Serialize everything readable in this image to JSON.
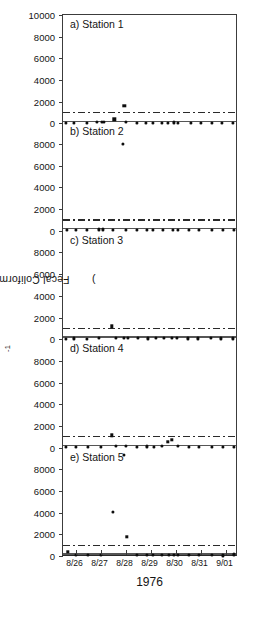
{
  "figure": {
    "ylabel_text": "Fecal Coliforms (cells · 100ml",
    "ylabel_sup": "-1",
    "ylabel_close": ")",
    "xlabel": "1976"
  },
  "axis": {
    "y_ticks": [
      0,
      2000,
      4000,
      6000,
      8000,
      10000
    ],
    "y_tick_labels": [
      "0",
      "2000",
      "4000",
      "6000",
      "8000",
      "10000"
    ],
    "ylim": [
      0,
      10000
    ],
    "x_tick_labels": [
      "8/26",
      "8/27",
      "8/28",
      "8/29",
      "8/30",
      "8/31",
      "9/01"
    ],
    "xlim": [
      0,
      7
    ]
  },
  "chart_data": {
    "type": "scatter",
    "title": "",
    "subtitle": "",
    "xlabel": "1976",
    "ylabel": "Fecal Coliforms (cells · 100ml-1)",
    "ylim": [
      0,
      10000
    ],
    "xlim": [
      0,
      7
    ],
    "grid": false,
    "legend": "none",
    "x_tick_labels": [
      "8/26",
      "8/27",
      "8/28",
      "8/29",
      "8/30",
      "8/31",
      "9/01"
    ],
    "y_tick_labels": [
      "0",
      "2000",
      "4000",
      "6000",
      "8000",
      "10000"
    ],
    "annotations": [
      "Each panel shares a 0-10000 y-scale.",
      "Upper dash-dot reference line at 1000 cells/100ml.",
      "Lower dash-dot reference line at 200 cells/100ml."
    ],
    "reference_lines": [
      {
        "name": "upper-standard",
        "value": 1000,
        "style": "dash-dot"
      },
      {
        "name": "lower-standard",
        "value": 200,
        "style": "dash-dot"
      }
    ],
    "panels": [
      {
        "id": "a",
        "label": "a) Station 1",
        "station": "Station 1",
        "x": [
          0.12,
          0.42,
          0.95,
          1.35,
          1.55,
          1.62,
          2.05,
          2.45,
          2.52,
          2.95,
          3.3,
          3.6,
          3.95,
          4.2,
          4.45,
          4.6,
          5.1,
          5.5,
          5.95,
          6.35,
          6.8
        ],
        "values": [
          60,
          70,
          60,
          120,
          150,
          160,
          380,
          1600,
          120,
          70,
          60,
          80,
          70,
          60,
          90,
          80,
          70,
          60,
          80,
          60,
          70
        ]
      },
      {
        "id": "b",
        "label": "b) Station 2",
        "station": "Station 2",
        "x": [
          0.15,
          0.5,
          0.95,
          1.45,
          1.6,
          2.0,
          2.4,
          2.5,
          2.95,
          3.35,
          3.6,
          4.0,
          4.4,
          4.6,
          5.05,
          5.45,
          5.95,
          6.4,
          6.85
        ],
        "values": [
          70,
          60,
          70,
          120,
          130,
          100,
          8050,
          110,
          80,
          90,
          70,
          80,
          110,
          90,
          70,
          80,
          70,
          60,
          80
        ]
      },
      {
        "id": "c",
        "label": "c) Station 3",
        "station": "Station 3",
        "x": [
          0.1,
          0.45,
          0.95,
          1.45,
          1.95,
          2.1,
          2.45,
          2.6,
          3.0,
          3.4,
          3.7,
          4.05,
          4.35,
          4.55,
          5.0,
          5.4,
          5.9,
          6.3,
          6.8
        ],
        "values": [
          60,
          70,
          60,
          90,
          1200,
          110,
          140,
          120,
          90,
          80,
          100,
          120,
          130,
          110,
          80,
          70,
          90,
          70,
          80
        ]
      },
      {
        "id": "d",
        "label": "d) Station 4",
        "station": "Station 4",
        "x": [
          0.12,
          0.5,
          1.0,
          1.5,
          1.95,
          2.1,
          2.5,
          2.95,
          3.35,
          3.65,
          3.95,
          4.2,
          4.35,
          4.6,
          5.05,
          5.45,
          5.95,
          6.4,
          6.85
        ],
        "values": [
          70,
          60,
          80,
          100,
          1150,
          120,
          130,
          90,
          110,
          100,
          120,
          560,
          700,
          130,
          90,
          80,
          70,
          60,
          90
        ]
      },
      {
        "id": "e",
        "label": "e) Station 5",
        "station": "Station 5",
        "x": [
          0.18,
          0.5,
          1.0,
          1.5,
          2.0,
          2.45,
          2.55,
          2.95,
          3.35,
          3.6,
          3.95,
          4.25,
          4.45,
          4.6,
          5.05,
          5.45,
          5.95,
          6.4,
          6.85
        ],
        "values": [
          400,
          80,
          70,
          90,
          4100,
          9300,
          1780,
          110,
          100,
          90,
          120,
          130,
          110,
          100,
          90,
          80,
          70,
          60,
          150
        ]
      }
    ]
  }
}
